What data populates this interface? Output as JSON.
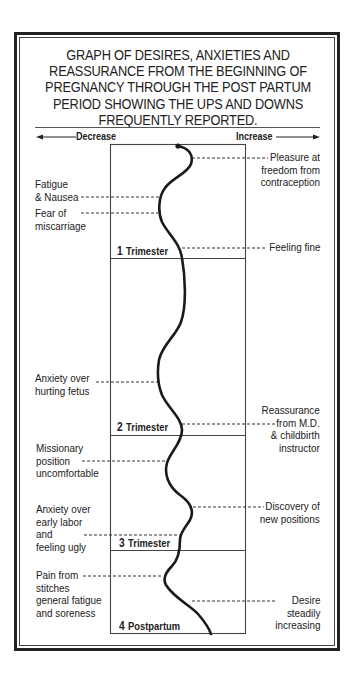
{
  "title_lines": [
    "GRAPH OF DESIRES, ANXIETIES AND",
    "REASSURANCE FROM THE BEGINNING OF",
    "PREGNANCY THROUGH THE POST PARTUM",
    "PERIOD SHOWING THE UPS AND DOWNS",
    "FREQUENTLY REPORTED."
  ],
  "axis": {
    "left_label": "Decrease",
    "right_label": "Increase"
  },
  "periods": [
    {
      "num": "1",
      "label": "Trimester"
    },
    {
      "num": "2",
      "label": "Trimester"
    },
    {
      "num": "3",
      "label": "Trimester"
    },
    {
      "num": "4",
      "label": "Postpartum"
    }
  ],
  "left_annotations": [
    {
      "lines": [
        "Fatigue",
        "& Nausea"
      ]
    },
    {
      "lines": [
        "Fear of",
        "miscarriage"
      ]
    },
    {
      "lines": [
        "Anxiety over",
        "hurting fetus"
      ]
    },
    {
      "lines": [
        "Missionary",
        "position",
        "uncomfortable"
      ]
    },
    {
      "lines": [
        "Anxiety over",
        "early labor",
        "and",
        "feeling ugly"
      ]
    },
    {
      "lines": [
        "Pain from",
        "stitches",
        "general fatigue",
        "and soreness"
      ]
    }
  ],
  "right_annotations": [
    {
      "lines": [
        "Pleasure at",
        "freedom from",
        "contraception"
      ]
    },
    {
      "lines": [
        "Feeling fine"
      ]
    },
    {
      "lines": [
        "Reassurance",
        "from M.D.",
        "& childbirth",
        "instructor"
      ]
    },
    {
      "lines": [
        "Discovery of",
        "new positions"
      ]
    },
    {
      "lines": [
        "Desire",
        "steadily",
        "increasing"
      ]
    }
  ]
}
